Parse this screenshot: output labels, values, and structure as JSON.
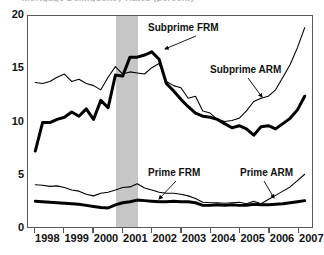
{
  "title_remnant": "Mortgage Delinquency Rates (percent)",
  "chart_data": {
    "type": "line",
    "title": "",
    "xlabel": "",
    "ylabel": "",
    "xlim": [
      1997.75,
      2007.5
    ],
    "ylim": [
      0,
      20
    ],
    "grid": false,
    "legend": "annotations",
    "x_tick_labels": [
      "1998",
      "1999",
      "2000",
      "2001",
      "2002",
      "2003",
      "2004",
      "2005",
      "2006",
      "2007"
    ],
    "x_tick_values": [
      1998,
      1999,
      2000,
      2001,
      2002,
      2003,
      2004,
      2005,
      2006,
      2007
    ],
    "y_tick_labels": [
      "0",
      "5",
      "10",
      "15",
      "20"
    ],
    "y_tick_values": [
      0,
      5,
      10,
      15,
      20
    ],
    "shaded_region": {
      "label": "2001 recession",
      "start": 2000.75,
      "end": 2001.5,
      "color": "#c6c6c6"
    },
    "x": [
      1998.0,
      1998.25,
      1998.5,
      1998.75,
      1999.0,
      1999.25,
      1999.5,
      1999.75,
      2000.0,
      2000.25,
      2000.5,
      2000.75,
      2001.0,
      2001.25,
      2001.5,
      2001.75,
      2002.0,
      2002.25,
      2002.5,
      2002.75,
      2003.0,
      2003.25,
      2003.5,
      2003.75,
      2004.0,
      2004.25,
      2004.5,
      2004.75,
      2005.0,
      2005.25,
      2005.5,
      2005.75,
      2006.0,
      2006.25,
      2006.5,
      2006.75,
      2007.0,
      2007.25
    ],
    "series": [
      {
        "name": "Subprime FRM",
        "style": "thick",
        "color": "#000000",
        "width": 3.0,
        "values": [
          7.2,
          9.9,
          9.9,
          10.2,
          10.4,
          10.9,
          10.5,
          11.2,
          10.2,
          12.0,
          11.3,
          14.4,
          14.3,
          16.1,
          16.1,
          16.3,
          16.6,
          15.9,
          13.6,
          12.9,
          12.1,
          11.4,
          10.8,
          10.5,
          10.4,
          10.2,
          9.8,
          9.4,
          9.6,
          9.3,
          8.7,
          9.5,
          9.6,
          9.3,
          9.8,
          10.3,
          11.1,
          12.4
        ]
      },
      {
        "name": "Subprime ARM",
        "style": "thin",
        "color": "#000000",
        "width": 1.1,
        "values": [
          13.7,
          13.6,
          13.8,
          14.2,
          14.5,
          13.8,
          14.0,
          13.6,
          13.4,
          13.0,
          14.2,
          15.2,
          14.5,
          14.7,
          14.6,
          14.5,
          15.1,
          15.5,
          13.8,
          13.4,
          13.2,
          12.2,
          12.4,
          11.0,
          10.8,
          10.2,
          10.0,
          10.1,
          10.3,
          11.0,
          11.9,
          12.2,
          12.4,
          13.0,
          14.2,
          15.4,
          17.0,
          18.9
        ]
      },
      {
        "name": "Prime FRM",
        "style": "thick",
        "color": "#000000",
        "width": 3.0,
        "values": [
          2.45,
          2.4,
          2.35,
          2.3,
          2.25,
          2.2,
          2.15,
          2.05,
          1.95,
          1.85,
          1.8,
          2.1,
          2.3,
          2.4,
          2.55,
          2.5,
          2.45,
          2.4,
          2.4,
          2.45,
          2.4,
          2.4,
          2.3,
          2.05,
          2.05,
          2.1,
          2.05,
          2.1,
          2.05,
          2.05,
          2.15,
          2.1,
          2.1,
          2.15,
          2.2,
          2.3,
          2.4,
          2.5
        ]
      },
      {
        "name": "Prime ARM",
        "style": "thin",
        "color": "#000000",
        "width": 1.1,
        "values": [
          4.0,
          3.95,
          3.85,
          3.9,
          3.75,
          3.5,
          3.4,
          3.1,
          2.95,
          3.2,
          3.3,
          3.5,
          3.75,
          3.8,
          4.1,
          3.7,
          3.5,
          3.3,
          3.2,
          3.2,
          3.1,
          2.95,
          2.7,
          2.35,
          2.3,
          2.3,
          2.25,
          2.3,
          2.35,
          2.2,
          2.45,
          2.2,
          2.6,
          3.0,
          3.4,
          3.8,
          4.4,
          5.0
        ]
      }
    ],
    "annotations": [
      {
        "text": "Subprime FRM",
        "x": 148,
        "y": 22,
        "leader_from": [
          196,
          36
        ],
        "leader_to": [
          165,
          49
        ]
      },
      {
        "text": "Subprime ARM",
        "x": 210,
        "y": 64,
        "leader_from": [
          248,
          78
        ],
        "leader_to": [
          262,
          97
        ]
      },
      {
        "text": "Prime FRM",
        "x": 148,
        "y": 167,
        "leader_from": [
          176,
          181
        ],
        "leader_to": [
          159,
          199
        ]
      },
      {
        "text": "Prime ARM",
        "x": 240,
        "y": 167,
        "leader_from": [
          264,
          181
        ],
        "leader_to": [
          274,
          198
        ]
      }
    ]
  }
}
